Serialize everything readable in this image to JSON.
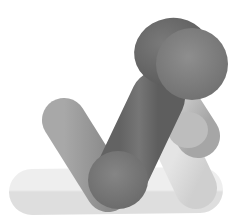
{
  "scene": {
    "description": "3D grayscale render of overlapping capsule/stick shapes",
    "background": "#ffffff",
    "colors": {
      "palest": "#e8e8e8",
      "pale": "#dcdcdc",
      "light": "#b9b9b9",
      "mid": "#9a9a9a",
      "dark": "#6e6e6e",
      "darkest": "#5e5e5e"
    }
  }
}
